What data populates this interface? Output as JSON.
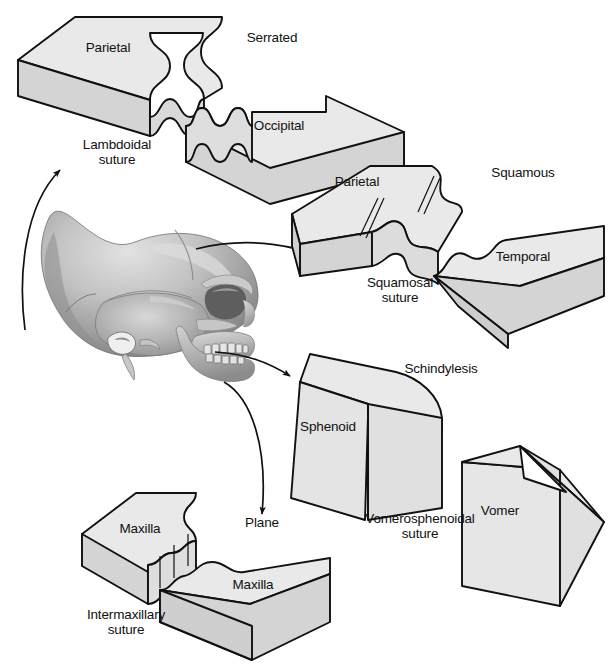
{
  "figure": {
    "background_color": "#ffffff",
    "line_color": "#111111",
    "face_top_color": "#e9e9e9",
    "face_side_color": "#d4d4d4",
    "face_edge_color": "#dedede",
    "skull_color": "#a8a8a8"
  },
  "center": {
    "name": "lateral-skull-illustration",
    "description": "Grayscale lateral view of a human skull"
  },
  "panels": [
    {
      "id": "serrated",
      "type_label": "Serrated",
      "suture_label": "Lambdoidal\nsuture",
      "bones": [
        "Parietal",
        "Occipital"
      ]
    },
    {
      "id": "squamous",
      "type_label": "Squamous",
      "suture_label": "Squamosal\nsuture",
      "bones": [
        "Parietal",
        "Temporal"
      ]
    },
    {
      "id": "schindylesis",
      "type_label": "Schindylesis",
      "suture_label": "Vomerosphenoidal\nsuture",
      "bones": [
        "Sphenoid",
        "Vomer"
      ]
    },
    {
      "id": "plane",
      "type_label": "Plane",
      "suture_label": "Intermaxillary\nsuture",
      "bones": [
        "Maxilla",
        "Maxilla"
      ]
    }
  ],
  "labels": {
    "serrated": "Serrated",
    "parietal_1": "Parietal",
    "occipital": "Occipital",
    "lambdoidal_suture": "Lambdoidal\nsuture",
    "squamous": "Squamous",
    "parietal_2": "Parietal",
    "temporal": "Temporal",
    "squamosal_suture": "Squamosal\nsuture",
    "schindylesis": "Schindylesis",
    "sphenoid": "Sphenoid",
    "vomer": "Vomer",
    "vomerosphenoidal_suture": "Vomerosphenoidal\nsuture",
    "plane": "Plane",
    "maxilla_1": "Maxilla",
    "maxilla_2": "Maxilla",
    "intermaxillary_suture": "Intermaxillary\nsuture"
  }
}
